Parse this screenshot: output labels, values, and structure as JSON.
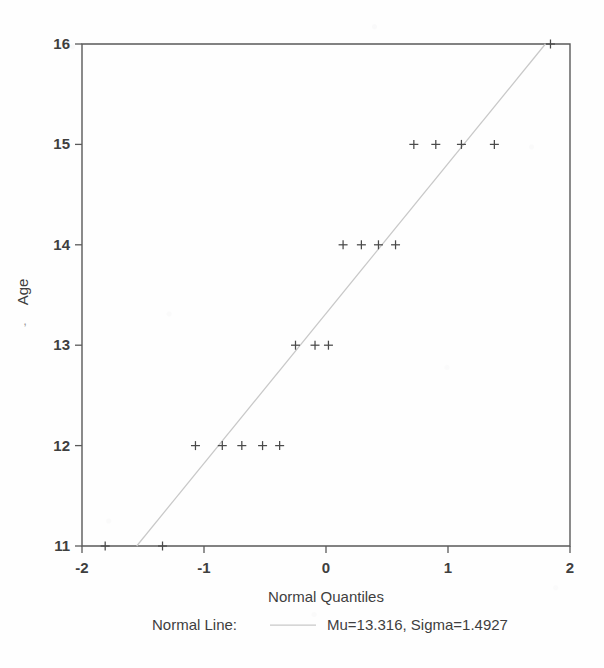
{
  "chart_data": {
    "type": "scatter",
    "title": "",
    "xlabel": "Normal Quantiles",
    "ylabel": "Age",
    "xlim": [
      -2,
      2
    ],
    "ylim": [
      11,
      16
    ],
    "xticks": [
      -2,
      -1,
      0,
      1,
      2
    ],
    "xtick_labels": [
      "-2",
      "-1",
      "0",
      "1",
      "2"
    ],
    "yticks": [
      11,
      12,
      13,
      14,
      15,
      16
    ],
    "ytick_labels": [
      "11",
      "12",
      "13",
      "14",
      "15",
      "16"
    ],
    "grid": false,
    "marker": "plus",
    "points": [
      {
        "x": -1.81,
        "y": 11
      },
      {
        "x": -1.34,
        "y": 11
      },
      {
        "x": -1.07,
        "y": 12
      },
      {
        "x": -0.85,
        "y": 12
      },
      {
        "x": -0.69,
        "y": 12
      },
      {
        "x": -0.52,
        "y": 12
      },
      {
        "x": -0.38,
        "y": 12
      },
      {
        "x": -0.25,
        "y": 13
      },
      {
        "x": -0.09,
        "y": 13
      },
      {
        "x": 0.02,
        "y": 13
      },
      {
        "x": 0.14,
        "y": 14
      },
      {
        "x": 0.29,
        "y": 14
      },
      {
        "x": 0.43,
        "y": 14
      },
      {
        "x": 0.57,
        "y": 14
      },
      {
        "x": 0.72,
        "y": 15
      },
      {
        "x": 0.9,
        "y": 15
      },
      {
        "x": 1.11,
        "y": 15
      },
      {
        "x": 1.38,
        "y": 15
      },
      {
        "x": 1.84,
        "y": 16
      }
    ],
    "reference_line": {
      "name": "Normal Line",
      "mu": 13.316,
      "sigma": 1.4927,
      "color": "#c8c8c8"
    }
  },
  "axes": {
    "x_title": "Normal Quantiles",
    "y_title": "Age",
    "y_title_artifact": ","
  },
  "legend": {
    "position": "below-axis",
    "series_label": "Normal Line:",
    "series_value": "Mu=13.316, Sigma=1.4927"
  },
  "colors": {
    "axis": "#5a5a5a",
    "text": "#3f3f3f",
    "marker": "#4a4a4a",
    "line": "#c8c8c8",
    "background": "#fefefe"
  }
}
